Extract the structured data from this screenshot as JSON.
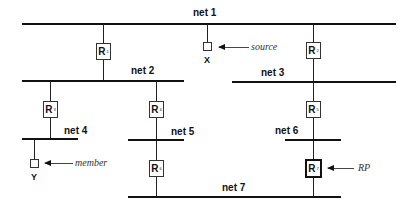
{
  "networks": [
    {
      "id": "net1",
      "label": "net 1"
    },
    {
      "id": "net2",
      "label": "net 2"
    },
    {
      "id": "net3",
      "label": "net 3"
    },
    {
      "id": "net4",
      "label": "net 4"
    },
    {
      "id": "net5",
      "label": "net 5"
    },
    {
      "id": "net6",
      "label": "net 6"
    },
    {
      "id": "net7",
      "label": "net 7"
    }
  ],
  "routers": [
    {
      "id": "R1",
      "letter": "R",
      "index": "1",
      "connects": [
        "net 1",
        "net 2"
      ]
    },
    {
      "id": "R2",
      "letter": "R",
      "index": "2",
      "connects": [
        "net 1",
        "net 3"
      ]
    },
    {
      "id": "R3",
      "letter": "R",
      "index": "3",
      "connects": [
        "net 2",
        "net 4"
      ]
    },
    {
      "id": "R4",
      "letter": "R",
      "index": "4",
      "connects": [
        "net 2",
        "net 5"
      ]
    },
    {
      "id": "R5",
      "letter": "R",
      "index": "5",
      "connects": [
        "net 3",
        "net 6"
      ]
    },
    {
      "id": "R6",
      "letter": "R",
      "index": "6",
      "connects": [
        "net 5",
        "net 7"
      ]
    },
    {
      "id": "R7",
      "letter": "R",
      "index": "7",
      "connects": [
        "net 6",
        "net 7"
      ],
      "highlighted": true
    }
  ],
  "hosts": [
    {
      "id": "X",
      "label": "X",
      "network": "net 1",
      "role": "source"
    },
    {
      "id": "Y",
      "label": "Y",
      "network": "net 4",
      "role": "member"
    }
  ],
  "annotations": {
    "source": "source",
    "member": "member",
    "rp": "RP"
  }
}
